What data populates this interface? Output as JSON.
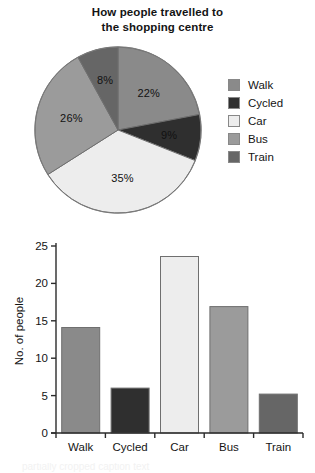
{
  "chart_data": [
    {
      "type": "pie",
      "title": "How people travelled to the shopping centre",
      "title_lines": [
        "How people travelled to",
        "the shopping centre"
      ],
      "categories": [
        "Walk",
        "Cycled",
        "Car",
        "Bus",
        "Train"
      ],
      "values": [
        22,
        9,
        35,
        26,
        8
      ],
      "value_labels": [
        "22%",
        "9%",
        "35%",
        "26%",
        "8%"
      ],
      "unit": "%",
      "colors": [
        "#8a8a8a",
        "#2f2f2f",
        "#ededed",
        "#9b9b9b",
        "#666666"
      ],
      "legend": {
        "position": "right",
        "entries": [
          {
            "label": "Walk",
            "color": "#8a8a8a"
          },
          {
            "label": "Cycled",
            "color": "#2f2f2f"
          },
          {
            "label": "Car",
            "color": "#ededed"
          },
          {
            "label": "Bus",
            "color": "#9b9b9b"
          },
          {
            "label": "Train",
            "color": "#666666"
          }
        ]
      },
      "start_angle_deg": 0,
      "direction": "clockwise",
      "grid": false
    },
    {
      "type": "bar",
      "title": "",
      "categories": [
        "Walk",
        "Cycled",
        "Car",
        "Bus",
        "Train"
      ],
      "values": [
        14.1,
        6.0,
        23.6,
        16.9,
        5.2
      ],
      "xlabel": "",
      "ylabel": "No. of people",
      "ylim": [
        0,
        25
      ],
      "yticks": [
        0,
        5,
        10,
        15,
        20,
        25
      ],
      "ytick_labels": [
        "0",
        "5",
        "10",
        "15",
        "20",
        "25"
      ],
      "colors": [
        "#8a8a8a",
        "#2f2f2f",
        "#ededed",
        "#9b9b9b",
        "#666666"
      ],
      "grid": false,
      "legend": {
        "position": "none",
        "entries": []
      }
    }
  ],
  "bottom_caption": "partially cropped caption text"
}
